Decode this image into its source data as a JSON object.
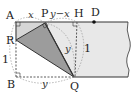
{
  "diagram": {
    "points": {
      "A": {
        "label": "A",
        "x": 15,
        "y": 22
      },
      "P": {
        "label": "P",
        "x": 45,
        "y": 23
      },
      "H": {
        "label": "H",
        "x": 77,
        "y": 22
      },
      "D": {
        "label": "D",
        "x": 94,
        "y": 22
      },
      "R": {
        "label": "R",
        "x": 16,
        "y": 40
      },
      "B": {
        "label": "B",
        "x": 16,
        "y": 76
      },
      "Q": {
        "label": "Q",
        "x": 74,
        "y": 77
      }
    },
    "segment_labels": {
      "AP": "x",
      "PH": "y−x",
      "PQ": "y",
      "HQ": "1",
      "AB": "1",
      "BQ": "y"
    },
    "colors": {
      "paper": "#e6e6e6",
      "folded": "#9a9a9a",
      "light_region": "#d0d0d0",
      "line": "#333333"
    }
  }
}
